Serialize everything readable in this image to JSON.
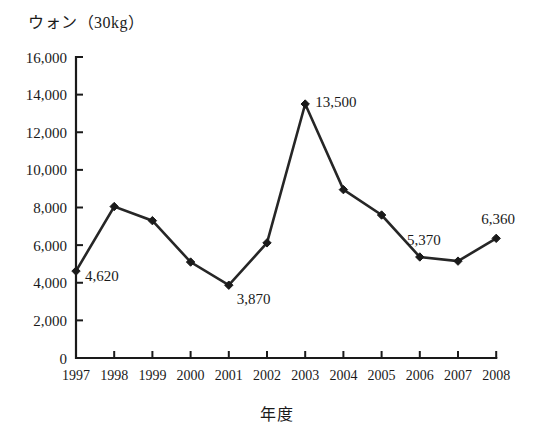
{
  "chart_data": {
    "type": "line",
    "title": "ウォン（30kg）",
    "xlabel": "年度",
    "ylabel": "ウォン（30kg）",
    "categories": [
      "1997",
      "1998",
      "1999",
      "2000",
      "2001",
      "2002",
      "2003",
      "2004",
      "2005",
      "2006",
      "2007",
      "2008"
    ],
    "values": [
      4620,
      8050,
      7300,
      5100,
      3870,
      6120,
      13500,
      8950,
      7600,
      5370,
      5150,
      6360
    ],
    "series": [
      {
        "name": "ウォン（30kg）",
        "values": [
          4620,
          8050,
          7300,
          5100,
          3870,
          6120,
          13500,
          8950,
          7600,
          5370,
          5150,
          6360
        ]
      }
    ],
    "point_labels": [
      {
        "category": "1997",
        "value": 4620,
        "text": "4,620",
        "shown": true
      },
      {
        "category": "1998",
        "value": 8050,
        "text": "",
        "shown": false
      },
      {
        "category": "1999",
        "value": 7300,
        "text": "",
        "shown": false
      },
      {
        "category": "2000",
        "value": 5100,
        "text": "",
        "shown": false
      },
      {
        "category": "2001",
        "value": 3870,
        "text": "3,870",
        "shown": true
      },
      {
        "category": "2002",
        "value": 6120,
        "text": "",
        "shown": false
      },
      {
        "category": "2003",
        "value": 13500,
        "text": "13,500",
        "shown": true
      },
      {
        "category": "2004",
        "value": 8950,
        "text": "",
        "shown": false
      },
      {
        "category": "2005",
        "value": 7600,
        "text": "",
        "shown": false
      },
      {
        "category": "2006",
        "value": 5370,
        "text": "5,370",
        "shown": true
      },
      {
        "category": "2007",
        "value": 5150,
        "text": "",
        "shown": false
      },
      {
        "category": "2008",
        "value": 6360,
        "text": "6,360",
        "shown": true
      }
    ],
    "ylim": [
      0,
      16000
    ],
    "ytick_values": [
      0,
      2000,
      4000,
      6000,
      8000,
      10000,
      12000,
      14000,
      16000
    ],
    "ytick_labels": [
      "0",
      "2,000",
      "4,000",
      "6,000",
      "8,000",
      "10,000",
      "12,000",
      "14,000",
      "16,000"
    ],
    "grid": false,
    "legend": false,
    "marker": "diamond",
    "line_color": "#262626",
    "axis_color": "#1a1a1a",
    "background_color": "#ffffff"
  }
}
